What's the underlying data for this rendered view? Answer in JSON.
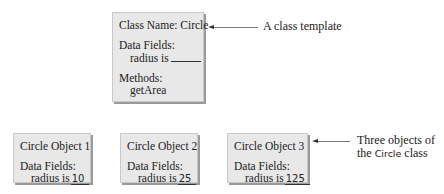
{
  "class_box": {
    "title": "Class Name: Circle",
    "fields_header": "Data Fields:",
    "field_label": "radius is",
    "methods_header": "Methods:",
    "method": "getArea"
  },
  "class_annotation": "A class template",
  "objects": [
    {
      "title": "Circle Object 1",
      "fields_header": "Data Fields:",
      "field_label": "radius is",
      "radius": "10"
    },
    {
      "title": "Circle Object 2",
      "fields_header": "Data Fields:",
      "field_label": "radius is",
      "radius": "25"
    },
    {
      "title": "Circle Object 3",
      "fields_header": "Data Fields:",
      "field_label": "radius is",
      "radius": "125"
    }
  ],
  "objects_annotation": {
    "line1": "Three objects of",
    "line2_prefix": "the",
    "line2_code": "Circle",
    "line2_suffix": "class"
  },
  "colors": {
    "box_fill": "#e8e8e8",
    "box_shadow": "#9a9a9a",
    "arrow": "#7a7a7a"
  }
}
